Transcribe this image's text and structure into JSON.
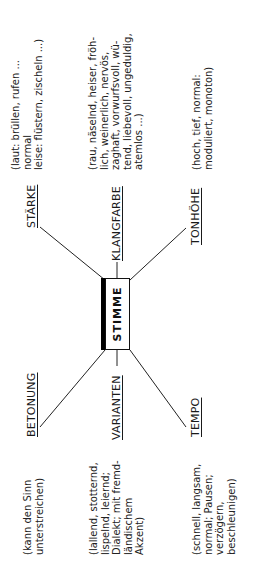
{
  "diagram": {
    "center": {
      "label": "STIMME"
    },
    "branches": [
      {
        "id": "staerke",
        "label": "STÄRKE",
        "note": "(laut: brüllen, rufen ...\nnormal\nleise: flüstern, zischeln ...)"
      },
      {
        "id": "klangfarbe",
        "label": "KLANGFARBE",
        "note": "(rau, näselnd, heiser, fröh-\nlich, weinerlich, nervös,\nzaghaft, vorwurfsvoll, wü-\ntend, liebevoll, ungeduldig,\natemlos ...)"
      },
      {
        "id": "tonhoehe",
        "label": "TONHÖHE",
        "note": "(hoch, tief, normal:\nmoduliert, monoton)"
      },
      {
        "id": "betonung",
        "label": "BETONUNG",
        "note": "(kann den Sinn\nunterstreichen)"
      },
      {
        "id": "varianten",
        "label": "VARIANTEN",
        "note": "(lallend, stotternd,\nlispelnd, leiernd;\nDialekt; mit fremd-\nländischem\nAkzent)"
      },
      {
        "id": "tempo",
        "label": "TEMPO",
        "note": "(schnell, langsam,\nnormal; Pausen;\nverzögern,\nbeschleunigen)"
      }
    ],
    "colors": {
      "ink": "#1a1a1a",
      "background": "#ffffff",
      "box_shadow": "#000000"
    }
  }
}
